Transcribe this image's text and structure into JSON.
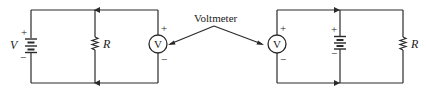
{
  "diagram": {
    "callout_label": "Voltmeter",
    "left_circuit": {
      "battery_label": "V",
      "battery_plus": "+",
      "battery_minus": "−",
      "resistor_label": "R",
      "meter_symbol": "V",
      "meter_plus": "+",
      "meter_minus": "−"
    },
    "right_circuit": {
      "meter_symbol": "V",
      "meter_plus": "+",
      "meter_minus": "−",
      "battery_plus": "+",
      "battery_minus": "−",
      "resistor_label": "R"
    },
    "colors": {
      "ink": "#2a2a2a",
      "background": "#ffffff"
    }
  }
}
